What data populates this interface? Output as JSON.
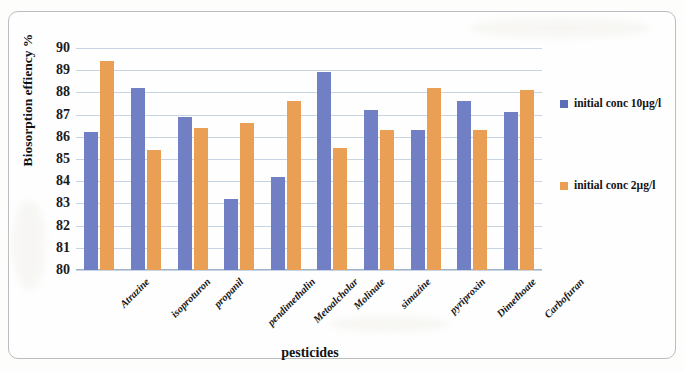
{
  "chart_data": {
    "type": "bar",
    "title": "",
    "xlabel": "pesticides",
    "ylabel": "Biosorption effiency %",
    "ylim": [
      80,
      90
    ],
    "yticks": [
      80,
      81,
      82,
      83,
      84,
      85,
      86,
      87,
      88,
      89,
      90
    ],
    "grid": true,
    "legend_position": "right",
    "categories": [
      "Atrazine",
      "isoproturon",
      "propanil",
      "pendimethalin",
      "Metoalcholar",
      "Molinate",
      "simazine",
      "pyriproxin",
      "Dimethoate",
      "Carbofuran"
    ],
    "series": [
      {
        "name": "initial conc 10µg/l",
        "color": "#7180c4",
        "values": [
          86.2,
          88.2,
          86.9,
          83.2,
          84.2,
          88.9,
          87.2,
          86.3,
          87.6,
          87.1
        ]
      },
      {
        "name": "initial conc 2µg/l",
        "color": "#e9a055",
        "values": [
          89.4,
          85.4,
          86.4,
          86.6,
          87.6,
          85.5,
          86.3,
          88.2,
          86.3,
          88.1
        ]
      }
    ]
  },
  "legend": {
    "entries": [
      {
        "label": "initial conc 10µg/l",
        "swatch": "series-0-swatch"
      },
      {
        "label": "initial conc 2µg/l",
        "swatch": "series-1-swatch"
      }
    ]
  }
}
